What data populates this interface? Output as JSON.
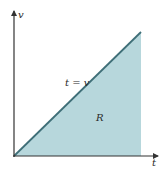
{
  "diagram": {
    "axes": {
      "vertical_label": "v",
      "horizontal_label": "t"
    },
    "line_label": "t = v",
    "region_label": "R",
    "colors": {
      "region_fill": "#b7d7dc",
      "line": "#3f6f78",
      "axis": "#333333"
    }
  }
}
